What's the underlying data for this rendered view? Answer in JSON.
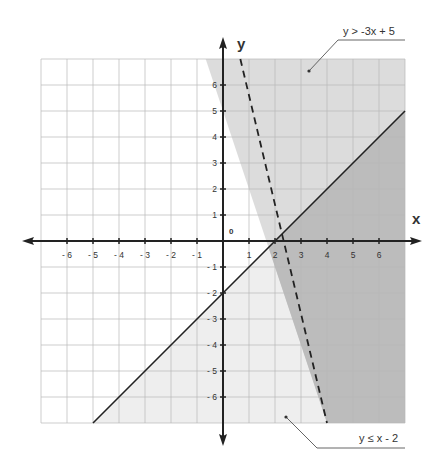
{
  "chart_data": {
    "type": "line",
    "title": "",
    "xlabel": "x",
    "ylabel": "y",
    "xlim": [
      -7,
      7
    ],
    "ylim": [
      -7,
      7
    ],
    "grid": true,
    "origin_label": "0",
    "x_ticks": [
      -6,
      -5,
      -4,
      -3,
      -2,
      -1,
      1,
      2,
      3,
      4,
      5,
      6
    ],
    "x_tick_labels": [
      "- 6",
      "- 5",
      "- 4",
      "- 3",
      "- 2",
      "- 1",
      "1",
      "2",
      "3",
      "4",
      "5",
      "6"
    ],
    "y_ticks": [
      6,
      5,
      4,
      3,
      2,
      1,
      -1,
      -2,
      -3,
      -4,
      -5,
      -6
    ],
    "y_tick_labels": [
      "6",
      "5",
      "4",
      "3",
      "2",
      "1",
      "- 1",
      "- 2",
      "- 3",
      "- 4",
      "- 5",
      "- 6"
    ],
    "series": [
      {
        "name": "y > -3x + 5",
        "equation": "y = -3x + 5",
        "slope": -3,
        "intercept": 5,
        "line_style": "dashed",
        "inequality": ">",
        "shaded_side": "above",
        "points": [
          [
            0.667,
            7
          ],
          [
            4,
            -7
          ]
        ]
      },
      {
        "name": "y ≤ x - 2",
        "equation": "y = x - 2",
        "slope": 1,
        "intercept": -2,
        "line_style": "solid",
        "inequality": "≤",
        "shaded_side": "below",
        "points": [
          [
            -5,
            -7
          ],
          [
            7,
            5
          ]
        ]
      }
    ],
    "annotations": [
      {
        "text": "y > -3x + 5",
        "points_to": [
          3.3,
          6.4
        ]
      },
      {
        "text": "y ≤ x - 2",
        "points_to": [
          2.4,
          -6.7
        ]
      }
    ],
    "intersection": [
      1.75,
      -0.25
    ]
  },
  "labels": {
    "x_axis": "x",
    "y_axis": "y",
    "origin": "0",
    "ineq1": "y > -3x + 5",
    "ineq2": "y ≤ x - 2"
  },
  "colors": {
    "region_ineq1": "#dcdcdc",
    "region_ineq2": "#eeeeee",
    "region_overlap": "#bcbcbc",
    "grid": "#b8b8b8",
    "axis": "#222222"
  }
}
